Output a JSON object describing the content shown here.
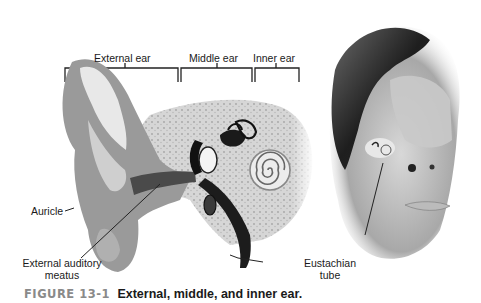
{
  "figure": {
    "number": "FIGURE 13-1",
    "caption": "External, middle, and inner ear."
  },
  "section_labels": [
    {
      "id": "external",
      "label": "External ear"
    },
    {
      "id": "middle",
      "label": "Middle ear"
    },
    {
      "id": "inner",
      "label": "Inner ear"
    }
  ],
  "callouts": {
    "auricle": "Auricle",
    "meatus_line1": "External auditory",
    "meatus_line2": "meatus",
    "eustachian_line1": "Eustachian",
    "eustachian_line2": "tube"
  },
  "illustrations": [
    {
      "name": "ear-cross-section",
      "description": "Cross-section of ear showing auricle, canal, ossicles, cochlea"
    },
    {
      "name": "head-profile",
      "description": "Three-quarter view of head with inner ear location highlighted"
    }
  ]
}
